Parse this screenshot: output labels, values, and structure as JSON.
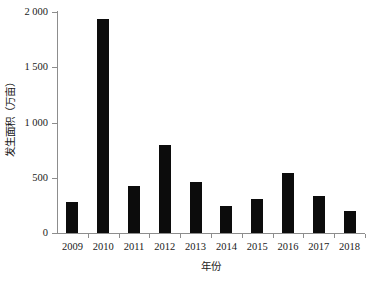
{
  "chart_data": {
    "type": "bar",
    "title": "",
    "subtitle": "",
    "xlabel": "年份",
    "ylabel": "发生面积（万亩）",
    "categories": [
      "2009",
      "2010",
      "2011",
      "2012",
      "2013",
      "2014",
      "2015",
      "2016",
      "2017",
      "2018"
    ],
    "values": [
      285,
      1935,
      430,
      800,
      460,
      240,
      305,
      545,
      335,
      200
    ],
    "series": [
      {
        "name": "发生面积",
        "values": [
          285,
          1935,
          430,
          800,
          460,
          240,
          305,
          545,
          335,
          200
        ]
      }
    ],
    "ylim": [
      0,
      2000
    ],
    "yticks": [
      0,
      500,
      1000,
      1500,
      2000
    ],
    "ytick_labels": [
      "0",
      "500",
      "1 000",
      "1 500",
      "2 000"
    ],
    "grid": false,
    "legend": false,
    "legend_position": "none",
    "bar_color": "#0c0c0c",
    "axis_color": "#8d8d8d",
    "background_color": "#ffffff",
    "annotations": []
  }
}
